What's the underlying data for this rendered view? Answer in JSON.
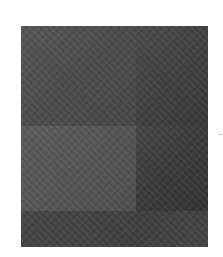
{
  "image": {
    "description": "dark gray textured photo",
    "colors": {
      "background": "#ffffff",
      "tone_light": "#5c5c5c",
      "tone_mid": "#4a4a4a",
      "tone_dark": "#333333"
    }
  }
}
